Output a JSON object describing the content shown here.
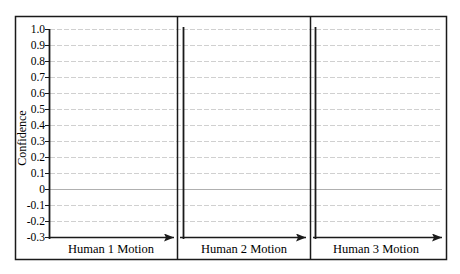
{
  "chart_data": {
    "type": "line",
    "title": "",
    "ylabel": "Confidence",
    "xlabel": "",
    "ylim": [
      -0.3,
      1.0
    ],
    "yticks": [
      "1.0",
      "0.9",
      "0.8",
      "0.7",
      "0.6",
      "0.5",
      "0.4",
      "0.3",
      "0.2",
      "0.1",
      "0",
      "-0.1",
      "-0.2",
      "-0.3"
    ],
    "grid": true,
    "legend": null,
    "panels": [
      {
        "label": "Human 1 Motion",
        "series": []
      },
      {
        "label": "Human 2 Motion",
        "series": []
      },
      {
        "label": "Human 3 Motion",
        "series": []
      }
    ]
  },
  "colors": {
    "axis": "#1a1a1a",
    "grid": "#d0d0d0",
    "zero_line": "#b0b0b0"
  }
}
